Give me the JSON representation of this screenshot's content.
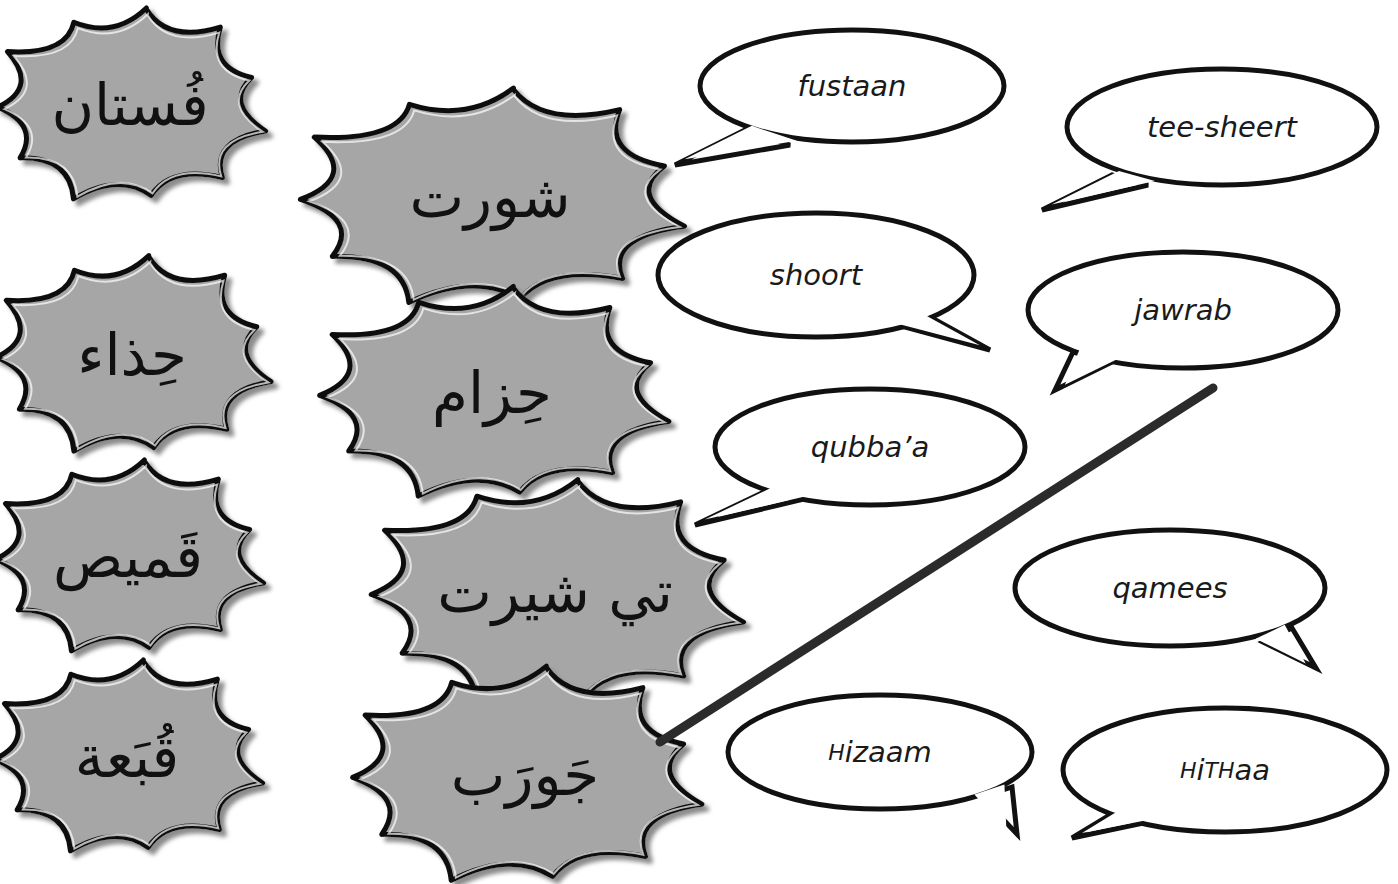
{
  "exercise": {
    "type": "match-arabic-to-transliteration",
    "colors": {
      "burst_fill": "#a6a6a6",
      "burst_stroke": "#111111",
      "burst_shadow": "#8c8c8c",
      "bubble_fill": "#ffffff",
      "bubble_stroke": "#111111",
      "match_line": "#2b2b2b",
      "background": "#ffffff"
    },
    "arabic_words": [
      {
        "id": "fustaan",
        "text": "فُستان",
        "cx": 130,
        "cy": 105,
        "rx": 115,
        "ry": 82
      },
      {
        "id": "shoort",
        "text": "شورت",
        "cx": 490,
        "cy": 197,
        "rx": 165,
        "ry": 92
      },
      {
        "id": "hithaa",
        "text": "حِذاء",
        "cx": 132,
        "cy": 355,
        "rx": 118,
        "ry": 84
      },
      {
        "id": "hizaam",
        "text": "حِزام",
        "cx": 492,
        "cy": 393,
        "rx": 150,
        "ry": 90
      },
      {
        "id": "qamees",
        "text": "قَميص",
        "cx": 128,
        "cy": 557,
        "rx": 115,
        "ry": 82
      },
      {
        "id": "tee-sheert",
        "text": "تي شيرت",
        "cx": 555,
        "cy": 592,
        "rx": 160,
        "ry": 95
      },
      {
        "id": "qubbaa",
        "text": "قُبَعة",
        "cx": 127,
        "cy": 757,
        "rx": 115,
        "ry": 82
      },
      {
        "id": "jawrab",
        "text": "جَورَب",
        "cx": 525,
        "cy": 775,
        "rx": 150,
        "ry": 92
      }
    ],
    "transliterations": [
      {
        "id": "fustaan",
        "text": "fustaan",
        "cx": 852,
        "cy": 86,
        "rx": 152,
        "ry": 56,
        "tail": [
          [
            745,
            130
          ],
          [
            675,
            165
          ],
          [
            790,
            145
          ]
        ]
      },
      {
        "id": "tee-sheert",
        "text": "tee-sheert",
        "cx": 1222,
        "cy": 127,
        "rx": 155,
        "ry": 58,
        "tail": [
          [
            1112,
            175
          ],
          [
            1042,
            210
          ],
          [
            1148,
            185
          ]
        ]
      },
      {
        "id": "shoort",
        "text": "shoort",
        "cx": 816,
        "cy": 275,
        "rx": 158,
        "ry": 62,
        "tail": [
          [
            930,
            317
          ],
          [
            990,
            350
          ],
          [
            905,
            327
          ]
        ]
      },
      {
        "id": "jawrab",
        "text": "jawrab",
        "cx": 1183,
        "cy": 310,
        "rx": 155,
        "ry": 58,
        "tail": [
          [
            1073,
            352
          ],
          [
            1055,
            390
          ],
          [
            1112,
            362
          ]
        ]
      },
      {
        "id": "qubbaa",
        "text": "qubba’a",
        "cx": 870,
        "cy": 447,
        "rx": 155,
        "ry": 58,
        "tail": [
          [
            768,
            490
          ],
          [
            695,
            525
          ],
          [
            800,
            500
          ]
        ]
      },
      {
        "id": "qamees",
        "text": "qamees",
        "cx": 1170,
        "cy": 588,
        "rx": 155,
        "ry": 58,
        "tail": [
          [
            1292,
            628
          ],
          [
            1316,
            668
          ],
          [
            1263,
            642
          ]
        ]
      },
      {
        "id": "hizaam",
        "text": "Hizaam",
        "cx": 880,
        "cy": 752,
        "rx": 152,
        "ry": 57,
        "tail": [
          [
            1012,
            787
          ],
          [
            1017,
            834
          ],
          [
            982,
            797
          ]
        ]
      },
      {
        "id": "hithaa",
        "text": "HiTHaa",
        "cx": 1225,
        "cy": 770,
        "rx": 162,
        "ry": 62,
        "tail": [
          [
            1115,
            812
          ],
          [
            1072,
            838
          ],
          [
            1148,
            822
          ]
        ]
      }
    ],
    "matches": [
      {
        "from": "jawrab",
        "to": "jawrab",
        "x1": 660,
        "y1": 742,
        "x2": 1213,
        "y2": 388
      }
    ]
  }
}
